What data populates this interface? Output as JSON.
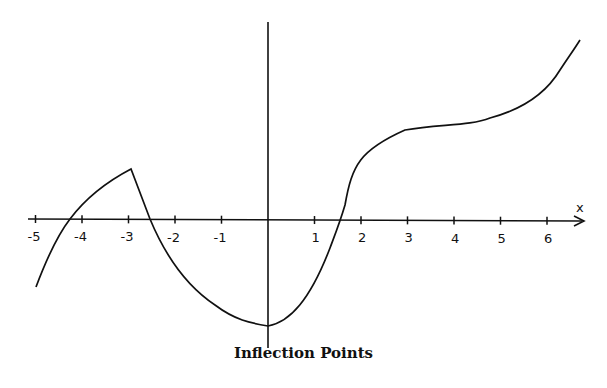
{
  "chart_data": {
    "type": "line",
    "title": "Inflection Points",
    "xlabel": "x",
    "ylabel": "",
    "xlim": [
      -5.2,
      6.8
    ],
    "x_ticks": [
      -5,
      -4,
      -3,
      -2,
      -1,
      1,
      2,
      3,
      4,
      5,
      6
    ],
    "x_tick_labels": [
      "-5",
      "-4",
      "-3",
      "-2",
      "-1",
      "1",
      "2",
      "3",
      "4",
      "5",
      "6"
    ],
    "grid": false,
    "series": [
      {
        "name": "f(x)",
        "points": [
          [
            -5.0,
            -1.5
          ],
          [
            -4.6,
            -0.6
          ],
          [
            -4.3,
            0.0
          ],
          [
            -4.0,
            0.45
          ],
          [
            -3.5,
            0.85
          ],
          [
            -3.0,
            1.05
          ],
          [
            -2.6,
            0.0
          ],
          [
            -2.0,
            -1.1
          ],
          [
            -1.5,
            -1.7
          ],
          [
            -1.0,
            -2.1
          ],
          [
            -0.5,
            -2.35
          ],
          [
            0.0,
            -2.45
          ],
          [
            0.5,
            -2.2
          ],
          [
            1.0,
            -1.6
          ],
          [
            1.5,
            -0.6
          ],
          [
            1.7,
            0.0
          ],
          [
            1.85,
            1.2
          ],
          [
            2.2,
            1.8
          ],
          [
            3.0,
            2.0
          ],
          [
            4.0,
            2.05
          ],
          [
            4.8,
            2.2
          ],
          [
            5.5,
            2.8
          ],
          [
            6.0,
            3.5
          ],
          [
            6.3,
            3.9
          ]
        ],
        "notes": "cusp at x=-3 (local max); local min at x=0; flat inflection region around x=3-4"
      }
    ]
  },
  "labels": {
    "title": "Inflection Points",
    "x_axis": "x",
    "ticks": [
      "-5",
      "-4",
      "-3",
      "-2",
      "-1",
      "1",
      "2",
      "3",
      "4",
      "5",
      "6"
    ]
  }
}
